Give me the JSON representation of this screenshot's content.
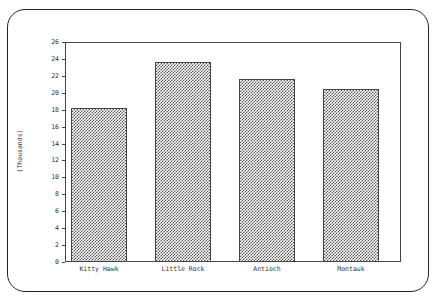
{
  "chart_data": {
    "type": "bar",
    "title": "",
    "xlabel": "",
    "ylabel": "(Thousands)",
    "categories": [
      "Kitty Hawk",
      "Little Rock",
      "Antioch",
      "Montauk"
    ],
    "values": [
      18.2,
      23.6,
      21.6,
      20.4
    ],
    "ylim": [
      0,
      26
    ],
    "yticks": [
      0,
      2,
      4,
      6,
      8,
      10,
      12,
      14,
      16,
      18,
      20,
      22,
      24,
      26
    ],
    "grid": false,
    "legend": null,
    "bar_fill": "dithered gray pattern",
    "colors": {
      "bar": "#555555",
      "axis": "#444444",
      "frame": "#222222"
    }
  },
  "labels": {
    "ylabel": "(Thousands)",
    "categories": [
      "Kitty Hawk",
      "Little Rock",
      "Antioch",
      "Montauk"
    ],
    "yticks": [
      "0",
      "2",
      "4",
      "6",
      "8",
      "10",
      "12",
      "14",
      "16",
      "18",
      "20",
      "22",
      "24",
      "26"
    ]
  }
}
